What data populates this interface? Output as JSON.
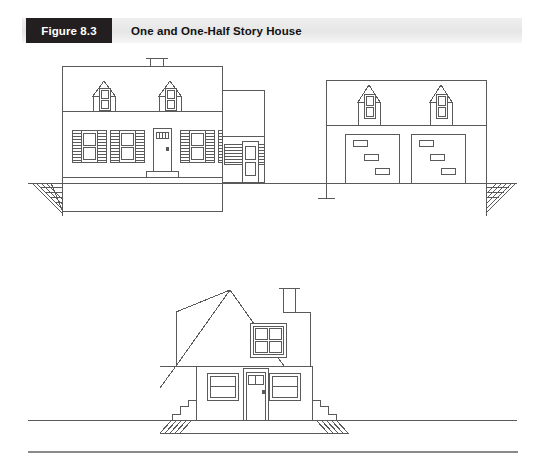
{
  "header": {
    "figure_tag": "Figure 8.3",
    "title": "One and One-Half Story House",
    "tag_bg": "#231f20",
    "tag_fg": "#ffffff",
    "band_bg": "#e9e9e9"
  },
  "figure": {
    "caption_number": "8.3",
    "caption_text": "One and One-Half Story House",
    "drawing_type": "architectural-elevation-line-drawing",
    "line_color": "#5a5a5a",
    "fill_color": "#ffffff",
    "views": [
      {
        "name": "front-elevation",
        "position": "upper",
        "description": "Front elevation of one and one-half story house with two gable dormers, central entry door, shuttered windows, connecting breezeway and two-car garage wing",
        "sections": [
          {
            "name": "main-house-block",
            "stories": "1.5",
            "chimney_count": 1,
            "dormers": 2,
            "dormer_window_panes": 2,
            "windows": 4,
            "window_panes": 2,
            "shutters_per_window": 2,
            "shutter_style": "louvered",
            "doors": 1,
            "door_light_panes": 4,
            "has_stoop": true
          },
          {
            "name": "breezeway",
            "doors": 1,
            "door_light_panes": 2,
            "railing_style": "louvered-lattice",
            "railing_panels": 2,
            "posts": 1
          },
          {
            "name": "garage-wing",
            "stories": "1.5",
            "dormers": 2,
            "dormer_window_panes": 2,
            "garage_doors": 2,
            "panels_per_garage_door": 3
          }
        ],
        "grade_hatch_ends": 2
      },
      {
        "name": "gable-end-elevation",
        "position": "lower",
        "description": "Gable end elevation with steep roof, chimney at ridge, four-pane attic window, entry door flanked by two windows, stepped foundation footings at both ends",
        "roof_style": "gable",
        "chimney_count": 1,
        "attic_window_panes": 4,
        "main_windows": 2,
        "main_window_panes": 2,
        "doors": 1,
        "door_light_panes": 2,
        "stepped_footings": 2,
        "grade_hatch_ends": 2
      }
    ]
  }
}
